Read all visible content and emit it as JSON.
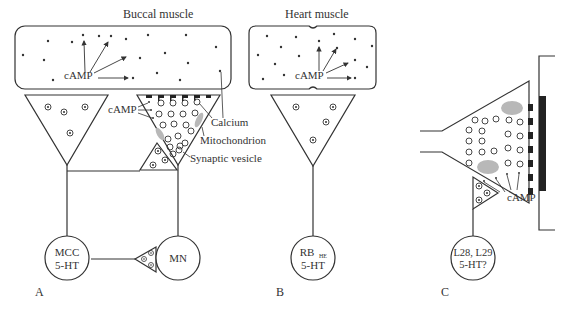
{
  "panels": {
    "A": {
      "letter": "A",
      "title": "Buccal muscle",
      "camp_muscle": "cAMP",
      "camp_terminal": "cAMP",
      "labels": {
        "calcium": "Calcium",
        "mitochondrion": "Mitochondrion",
        "synaptic_vesicle": "Synaptic vesicle"
      },
      "neurons": {
        "mcc_line1": "MCC",
        "mcc_line2": "5-HT",
        "mn": "MN"
      }
    },
    "B": {
      "letter": "B",
      "title": "Heart muscle",
      "camp": "cAMP",
      "neuron_line1": "RB",
      "neuron_sub": "HE",
      "neuron_line2": "5-HT"
    },
    "C": {
      "letter": "C",
      "camp": "cAMP",
      "neuron_line1": "L28, L29",
      "neuron_line2": "5-HT?"
    }
  },
  "colors": {
    "line": "#333333",
    "mitochondrion": "#b8b8b8",
    "muscle_bar": "#222222"
  }
}
